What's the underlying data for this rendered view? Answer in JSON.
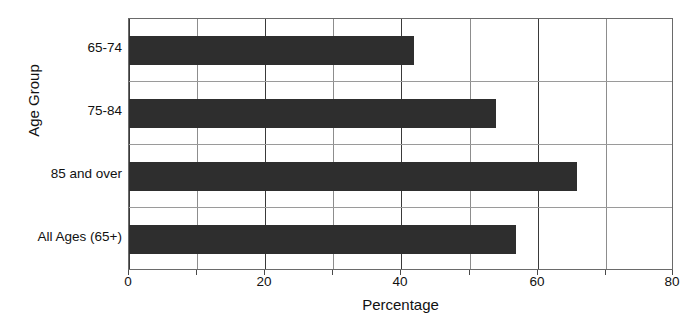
{
  "chart_data": {
    "type": "bar",
    "orientation": "horizontal",
    "title": "",
    "xlabel": "Percentage",
    "ylabel": "Age Group",
    "categories": [
      "65-74",
      "75-84",
      "85 and over",
      "All Ages (65+)"
    ],
    "values": [
      42,
      54,
      66,
      57
    ],
    "xlim": [
      0,
      80
    ],
    "xticks": [
      0,
      20,
      40,
      60,
      80
    ],
    "xtick_labels": [
      "0",
      "20",
      "40",
      "60",
      "80"
    ],
    "minor_xticks": [
      10,
      30,
      50,
      70
    ],
    "grid": "vertical-major-and-minor",
    "legend": "none",
    "bar_color": "#2e2e2e",
    "series": [
      {
        "name": "Percentage",
        "values": [
          42,
          54,
          66,
          57
        ]
      }
    ]
  },
  "figure": {
    "background_color": "#ffffff",
    "axis_color": "#6a6a6a",
    "gridline_color": "#3a3a3a",
    "text_color": "#111111"
  }
}
